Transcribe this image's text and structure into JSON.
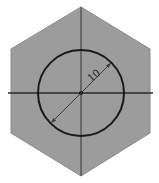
{
  "diagram": {
    "type": "technical-drawing",
    "colors": {
      "background": "#ffffff",
      "hexagon_fill": "#9c9c9c",
      "hexagon_edge": "#8a8a8a",
      "outline": "#1a1a1a",
      "centerline": "#2a2a2a",
      "dimension": "#3a3a3a"
    },
    "hexagon": {
      "points": [
        [
          81,
          7
        ],
        [
          150,
          49
        ],
        [
          150,
          133
        ],
        [
          81,
          176
        ],
        [
          11,
          133
        ],
        [
          11,
          49
        ]
      ]
    },
    "circle": {
      "cx": 81,
      "cy": 93,
      "r": 43
    },
    "centerlines": {
      "horizontal": {
        "x1": 8,
        "y1": 93,
        "x2": 153,
        "y2": 93
      },
      "vertical": {
        "x1": 81,
        "y1": 7,
        "x2": 81,
        "y2": 176
      }
    },
    "dimension": {
      "label": "10",
      "x1": 51,
      "y1": 123,
      "x2": 111,
      "y2": 63,
      "label_x": 96,
      "label_y": 78,
      "label_rotation": -40
    }
  }
}
